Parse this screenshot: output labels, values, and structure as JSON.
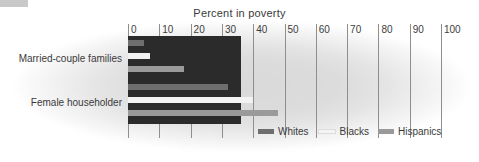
{
  "chart_data": {
    "type": "bar",
    "orientation": "horizontal",
    "title": "Percent in poverty",
    "xlabel": "",
    "ylabel": "",
    "xlim": [
      0,
      100
    ],
    "xticks": [
      0,
      10,
      20,
      30,
      40,
      50,
      60,
      70,
      80,
      90,
      100
    ],
    "xtick_labels": [
      "0",
      "10",
      "20",
      "30",
      "40",
      "50",
      "60",
      "70",
      "80",
      "90",
      "100"
    ],
    "grid": true,
    "legend_position": "bottom-right",
    "categories": [
      "Married-couple families",
      "Female householder"
    ],
    "series": [
      {
        "name": "Whites",
        "color": "#6e6e6e",
        "values": [
          5,
          32
        ]
      },
      {
        "name": "Blacks",
        "color": "#f2f2f2",
        "values": [
          7,
          40
        ]
      },
      {
        "name": "Hispanics",
        "color": "#9a9a9a",
        "values": [
          18,
          48
        ]
      }
    ]
  },
  "figure": {
    "title": "Percent in poverty",
    "axis": {
      "ticks": [
        "0",
        "10",
        "20",
        "30",
        "40",
        "50",
        "60",
        "70",
        "80",
        "90",
        "100"
      ]
    },
    "groups": [
      {
        "label": "Married-couple families"
      },
      {
        "label": "Female householder"
      }
    ],
    "legend": [
      {
        "label": "Whites",
        "swatch": "whites"
      },
      {
        "label": "Blacks",
        "swatch": "blacks"
      },
      {
        "label": "Hispanics",
        "swatch": "hispanics"
      }
    ],
    "colors": {
      "whites": "#6e6e6e",
      "blacks": "#f2f2f2",
      "hispanics": "#9a9a9a",
      "backdrop": "#2b2b2b"
    }
  }
}
